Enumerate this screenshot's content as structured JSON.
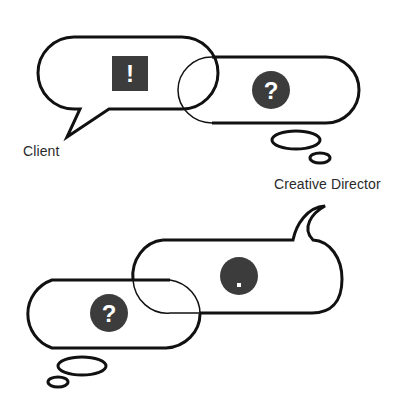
{
  "diagram": {
    "colors": {
      "stroke": "#111111",
      "icon_fill": "#3c3c3c",
      "icon_glyph": "#ffffff",
      "label_text": "#2a2a2a",
      "background": "#ffffff"
    },
    "top_scene": {
      "client_bubble": {
        "type": "speech",
        "icon": "exclamation-square",
        "glyph": "!"
      },
      "director_bubble": {
        "type": "thought",
        "icon": "question-circle",
        "glyph": "?"
      },
      "labels": {
        "client": "Client",
        "director": "Creative Director"
      }
    },
    "bottom_scene": {
      "client_bubble": {
        "type": "thought",
        "icon": "question-circle",
        "glyph": "?"
      },
      "director_bubble": {
        "type": "speech",
        "icon": "period-circle",
        "glyph": "."
      }
    }
  }
}
